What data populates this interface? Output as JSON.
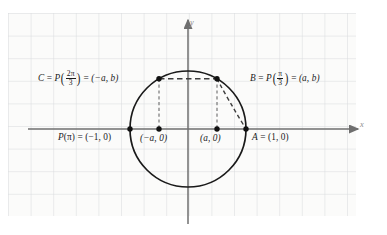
{
  "figure": {
    "kind": "unit-circle-diagram",
    "colors": {
      "grid": "#d8dade",
      "paper": "#fbfbfa",
      "axis": "#6f6f6f",
      "curve": "#1a1a1a",
      "dash": "#555555",
      "point": "#111111",
      "label": "#1a1a1a",
      "axis_label": "#8d8d8d"
    },
    "grid": {
      "spacing": 22.6,
      "left": 8,
      "top": 13,
      "right": 356,
      "bottom": 216,
      "visible": true
    },
    "axes": {
      "x_label": "x",
      "y_label": "y",
      "origin": {
        "x": 188,
        "y": 129
      },
      "x_from": 28,
      "x_to": 358,
      "y_from": 20,
      "y_to": 224
    },
    "circle": {
      "center_x": 188,
      "center_y": 129,
      "radius": 58
    },
    "points": [
      {
        "id": "C",
        "x": 159,
        "y": 78.8,
        "label_key": "label_C"
      },
      {
        "id": "B",
        "x": 217,
        "y": 78.8,
        "label_key": "label_B"
      },
      {
        "id": "Ppi",
        "x": 130,
        "y": 129,
        "label_key": "label_Ppi"
      },
      {
        "id": "nega",
        "x": 159,
        "y": 129,
        "label_key": "label_nega"
      },
      {
        "id": "posa",
        "x": 217,
        "y": 129,
        "label_key": "label_posa"
      },
      {
        "id": "A",
        "x": 246,
        "y": 129,
        "label_key": "label_A"
      }
    ],
    "labels": {
      "label_C": {
        "lead": "C",
        "eq1": " = ",
        "fn": "P",
        "num": "2π",
        "den": "3",
        "eq2": " = ",
        "coords": "(−a, b)"
      },
      "label_B": {
        "lead": "B",
        "eq1": " = ",
        "fn": "P",
        "num": "π",
        "den": "3",
        "eq2": " = ",
        "coords": "(a, b)"
      },
      "label_Ppi": {
        "text_fn": "P",
        "text_arg": "(π)",
        "eq": " = ",
        "coords": "(−1, 0)"
      },
      "label_nega": {
        "coords": "(−a, 0)"
      },
      "label_posa": {
        "coords": "(a, 0)"
      },
      "label_A": {
        "lead": "A",
        "eq": " = ",
        "coords": "(1, 0)"
      }
    },
    "dashed_segments": [
      {
        "name": "chord-C-to-B",
        "x1": 159,
        "y1": 78.8,
        "x2": 217,
        "y2": 78.8
      },
      {
        "name": "drop-C-to-xaxis",
        "x1": 159,
        "y1": 78.8,
        "x2": 159,
        "y2": 129
      },
      {
        "name": "drop-B-to-xaxis",
        "x1": 217,
        "y1": 78.8,
        "x2": 217,
        "y2": 129
      }
    ],
    "dashed_arc": {
      "name": "chord-B-to-A",
      "x1": 217,
      "y1": 78.8,
      "x2": 246,
      "y2": 129,
      "cx": 228,
      "cy": 100
    }
  }
}
